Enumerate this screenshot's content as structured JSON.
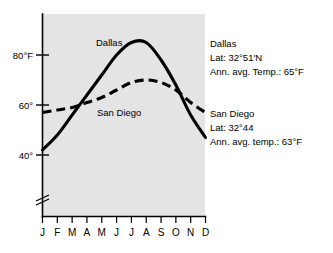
{
  "chart_data": {
    "type": "line",
    "title": "",
    "xlabel": "",
    "ylabel": "",
    "categories": [
      "J",
      "F",
      "M",
      "A",
      "M",
      "J",
      "J",
      "A",
      "S",
      "O",
      "N",
      "D"
    ],
    "category_names": [
      "January",
      "February",
      "March",
      "April",
      "May",
      "June",
      "July",
      "August",
      "September",
      "October",
      "November",
      "December"
    ],
    "ylim": [
      30,
      90
    ],
    "y_ticks": [
      40,
      60,
      80
    ],
    "y_tick_labels": [
      "40°",
      "60°",
      "80°F"
    ],
    "grid": false,
    "legend_position": "inline-labels",
    "axis_break": true,
    "series": [
      {
        "name": "Dallas",
        "style": "solid",
        "values": [
          42,
          48,
          56,
          64,
          72,
          80,
          85,
          85,
          78,
          68,
          56,
          47
        ]
      },
      {
        "name": "San Diego",
        "style": "dashed",
        "values": [
          57,
          58,
          59,
          61,
          63,
          66,
          69,
          70,
          69,
          66,
          61,
          57
        ]
      }
    ],
    "annotations": [
      {
        "id": "dallas-info",
        "lines": [
          "Dallas",
          "Lat: 32°51'N",
          "Ann. avg. Temp.: 65°F"
        ]
      },
      {
        "id": "san-diego-info",
        "lines": [
          "San Diego",
          "Lat: 32°44",
          "Ann. avg. temp.: 63°F"
        ]
      }
    ],
    "inline_labels": [
      {
        "id": "dallas-curve-label",
        "text": "Dallas"
      },
      {
        "id": "san-diego-curve-label",
        "text": "San Diego"
      }
    ],
    "colors": {
      "plot_background": "#e4e4e4",
      "page_background": "#ffffff",
      "ink": "#000000"
    }
  },
  "corner": {
    "text": ""
  }
}
